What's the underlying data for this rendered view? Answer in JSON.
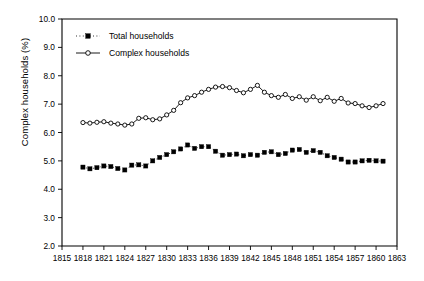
{
  "chart_data": {
    "type": "line",
    "title": "",
    "xlabel": "",
    "ylabel": "Complex households (%)",
    "xlim": [
      1815,
      1863
    ],
    "ylim": [
      2.0,
      10.0
    ],
    "grid": false,
    "legend_position": "top-left",
    "xticks": [
      1815,
      1818,
      1821,
      1824,
      1827,
      1830,
      1833,
      1836,
      1839,
      1842,
      1845,
      1848,
      1851,
      1854,
      1857,
      1860,
      1863
    ],
    "yticks": [
      "2.0",
      "3.0",
      "4.0",
      "5.0",
      "6.0",
      "7.0",
      "8.0",
      "9.0",
      "10.0"
    ],
    "series": [
      {
        "name": "Total households",
        "marker": "filled-square",
        "linestyle": "dotted",
        "color": "#000000",
        "x": [
          1818,
          1819,
          1820,
          1821,
          1822,
          1823,
          1824,
          1825,
          1826,
          1827,
          1828,
          1829,
          1830,
          1831,
          1832,
          1833,
          1834,
          1835,
          1836,
          1837,
          1838,
          1839,
          1840,
          1841,
          1842,
          1843,
          1844,
          1845,
          1846,
          1847,
          1848,
          1849,
          1850,
          1851,
          1852,
          1853,
          1854,
          1855,
          1856,
          1857,
          1858,
          1859,
          1860,
          1861
        ],
        "values": [
          4.78,
          4.72,
          4.76,
          4.82,
          4.8,
          4.73,
          4.68,
          4.85,
          4.86,
          4.82,
          5.0,
          5.12,
          5.22,
          5.32,
          5.42,
          5.56,
          5.44,
          5.5,
          5.5,
          5.34,
          5.2,
          5.22,
          5.24,
          5.18,
          5.22,
          5.2,
          5.3,
          5.32,
          5.22,
          5.26,
          5.38,
          5.4,
          5.3,
          5.36,
          5.3,
          5.18,
          5.12,
          5.06,
          4.96,
          4.96,
          5.0,
          5.02,
          5.0,
          4.99
        ]
      },
      {
        "name": "Complex households",
        "marker": "open-circle",
        "linestyle": "solid",
        "color": "#000000",
        "x": [
          1818,
          1819,
          1820,
          1821,
          1822,
          1823,
          1824,
          1825,
          1826,
          1827,
          1828,
          1829,
          1830,
          1831,
          1832,
          1833,
          1834,
          1835,
          1836,
          1837,
          1838,
          1839,
          1840,
          1841,
          1842,
          1843,
          1844,
          1845,
          1846,
          1847,
          1848,
          1849,
          1850,
          1851,
          1852,
          1853,
          1854,
          1855,
          1856,
          1857,
          1858,
          1859,
          1860,
          1861
        ],
        "values": [
          6.35,
          6.33,
          6.36,
          6.38,
          6.33,
          6.3,
          6.26,
          6.3,
          6.5,
          6.52,
          6.45,
          6.48,
          6.62,
          6.78,
          7.05,
          7.22,
          7.3,
          7.42,
          7.52,
          7.6,
          7.62,
          7.58,
          7.48,
          7.4,
          7.52,
          7.66,
          7.42,
          7.3,
          7.24,
          7.34,
          7.2,
          7.26,
          7.14,
          7.26,
          7.12,
          7.24,
          7.1,
          7.2,
          7.04,
          7.02,
          6.94,
          6.88,
          6.94,
          7.02
        ]
      }
    ]
  },
  "legend": {
    "items": [
      {
        "label": "Total households"
      },
      {
        "label": "Complex households"
      }
    ]
  }
}
